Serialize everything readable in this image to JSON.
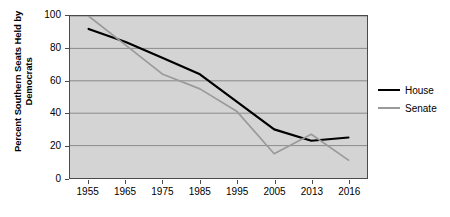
{
  "chart_data": {
    "type": "line",
    "title": "",
    "xlabel": "",
    "ylabel": "Percent Southern Seats Held by Democrats",
    "ylabel_lines": [
      "Percent Southern Seats Held by",
      "Democrats"
    ],
    "categories": [
      "1955",
      "1965",
      "1975",
      "1985",
      "1995",
      "2005",
      "2013",
      "2016"
    ],
    "series": [
      {
        "name": "House",
        "color": "#000000",
        "values": [
          92,
          84,
          74,
          64,
          47,
          30,
          23,
          25
        ]
      },
      {
        "name": "Senate",
        "color": "#9a9a9a",
        "values": [
          100,
          82,
          64,
          55,
          41,
          15,
          27,
          11
        ]
      }
    ],
    "ylim": [
      0,
      100
    ],
    "yticks": [
      "0",
      "20",
      "40",
      "60",
      "80",
      "100"
    ],
    "ytick_values": [
      0,
      20,
      40,
      60,
      80,
      100
    ],
    "grid": "horizontal",
    "legend_position": "right",
    "plot_background": "#d4d4d4",
    "axis_color": "#4a4a4a",
    "gridline_color": "#8a8a8a"
  },
  "legend": {
    "items": [
      {
        "label": "House"
      },
      {
        "label": "Senate"
      }
    ]
  }
}
